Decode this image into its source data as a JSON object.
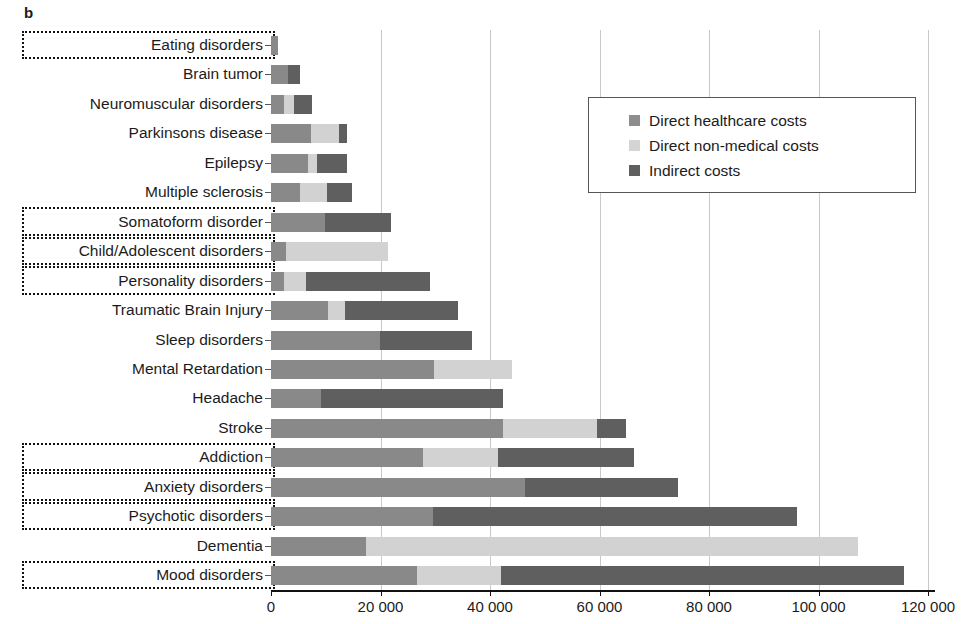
{
  "panel": {
    "letter": "b"
  },
  "legend": {
    "position": "top-right",
    "items": [
      {
        "name": "Direct healthcare costs",
        "color": "#8d8d8d"
      },
      {
        "name": "Direct non-medical costs",
        "color": "#d4d4d4"
      },
      {
        "name": "Indirect costs",
        "color": "#5f5f5f"
      }
    ]
  },
  "axis": {
    "ticklabels": [
      "0",
      "20 000",
      "40 000",
      "60 000",
      "80 000",
      "100 000",
      "120 000"
    ],
    "tickvalues": [
      0,
      20000,
      40000,
      60000,
      80000,
      100000,
      120000
    ]
  },
  "chart_data": {
    "type": "bar",
    "orientation": "horizontal",
    "stacked": true,
    "title": "",
    "xlabel": "",
    "ylabel": "",
    "xlim": [
      0,
      120000
    ],
    "grid": "vertical",
    "legend_position": "top-right",
    "categories": [
      "Eating disorders",
      "Brain tumor",
      "Neuromuscular disorders",
      "Parkinsons disease",
      "Epilepsy",
      "Multiple sclerosis",
      "Somatoform disorder",
      "Child/Adolescent disorders",
      "Personality disorders",
      "Traumatic Brain Injury",
      "Sleep disorders",
      "Mental Retardation",
      "Headache",
      "Stroke",
      "Addiction",
      "Anxiety disorders",
      "Psychotic disorders",
      "Dementia",
      "Mood disorders"
    ],
    "highlighted_categories": [
      "Eating disorders",
      "Somatoform disorder",
      "Child/Adolescent disorders",
      "Personality disorders",
      "Addiction",
      "Anxiety disorders",
      "Psychotic disorders",
      "Mood disorders"
    ],
    "series": [
      {
        "name": "Direct healthcare costs",
        "color": "#898989",
        "values": [
          1300,
          3100,
          2400,
          7300,
          6800,
          5300,
          9900,
          2700,
          2400,
          10400,
          19900,
          29800,
          9100,
          42400,
          27700,
          46400,
          29600,
          17400,
          26700
        ]
      },
      {
        "name": "Direct non-medical costs",
        "color": "#d2d2d2",
        "values": [
          0,
          0,
          1800,
          5100,
          1600,
          4900,
          0,
          18700,
          4000,
          3100,
          0,
          14200,
          0,
          17100,
          13800,
          0,
          0,
          89800,
          15300
        ]
      },
      {
        "name": "Indirect costs",
        "color": "#5f5f5f",
        "values": [
          0,
          2200,
          3300,
          1500,
          5500,
          4600,
          12000,
          0,
          22600,
          20700,
          16800,
          0,
          33300,
          5300,
          24800,
          27900,
          66500,
          0,
          73600
        ]
      }
    ],
    "totals": [
      1300,
      5300,
      7500,
      13900,
      13900,
      14800,
      21900,
      21400,
      29000,
      34200,
      36700,
      44000,
      42400,
      64800,
      66300,
      74300,
      96100,
      107200,
      115600
    ]
  }
}
